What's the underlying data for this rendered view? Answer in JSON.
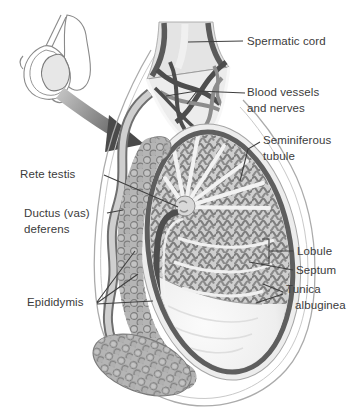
{
  "figure": {
    "labels": {
      "spermatic_cord": "Spermatic cord",
      "blood_vessels": "Blood vessels\nand nerves",
      "seminiferous_tubule": "Seminiferous\ntubule",
      "rete_testis": "Rete testis",
      "ductus_deferens": "Ductus (vas)\ndeferens",
      "epididymis": "Epididymis",
      "lobule": "Lobule",
      "septum": "Septum",
      "tunica_albuginea": "Tunica\nalbuginea"
    },
    "colors": {
      "background": "#ffffff",
      "label_text": "#3b3b3b",
      "leader_line": "#3f3f3f",
      "testis_rim_dark": "#5e5e5e",
      "vessel_dark": "#4d4d4d",
      "vessel_light": "#8c8c8c",
      "tissue_light": "#ececec",
      "tubule_coil": "#7e7e7e",
      "epididymis_gray": "#b5b5b5",
      "arrow_dark": "#4a4a4a"
    }
  }
}
